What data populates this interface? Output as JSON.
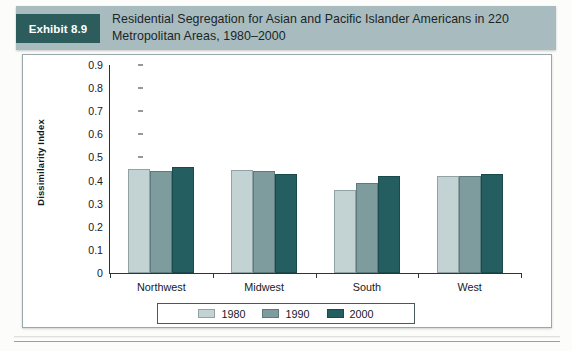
{
  "header": {
    "badge_label": "Exhibit 8.9",
    "title": "Residential Segregation for Asian and Pacific Islander Americans in 220 Metropolitan Areas, 1980–2000",
    "badge_color": "#2c5c5c",
    "bar_color": "#a8bcc0"
  },
  "chart_data": {
    "type": "bar",
    "title": "Residential Segregation for Asian and Pacific Islander Americans in 220 Metropolitan Areas, 1980–2000",
    "xlabel": "",
    "ylabel": "Dissimilarity Index",
    "categories": [
      "Northwest",
      "Midwest",
      "South",
      "West"
    ],
    "series": [
      {
        "name": "1980",
        "color": "#c3d3d4",
        "values": [
          0.45,
          0.445,
          0.36,
          0.42
        ]
      },
      {
        "name": "1990",
        "color": "#7e9b9d",
        "values": [
          0.44,
          0.44,
          0.39,
          0.42
        ]
      },
      {
        "name": "2000",
        "color": "#255e60",
        "values": [
          0.46,
          0.43,
          0.42,
          0.43
        ]
      }
    ],
    "ylim": [
      0,
      0.9
    ],
    "ytick_labels": [
      "0.9",
      "0.8",
      "0.7",
      "0.6",
      "0.5",
      "0.4",
      "0.3",
      "0.2",
      "0.1",
      "0"
    ],
    "ytick_values": [
      0.9,
      0.8,
      0.7,
      0.6,
      0.5,
      0.4,
      0.3,
      0.2,
      0.1,
      0
    ],
    "grid": false,
    "legend_position": "bottom",
    "legend_entries": [
      "1980",
      "1990",
      "2000"
    ]
  }
}
